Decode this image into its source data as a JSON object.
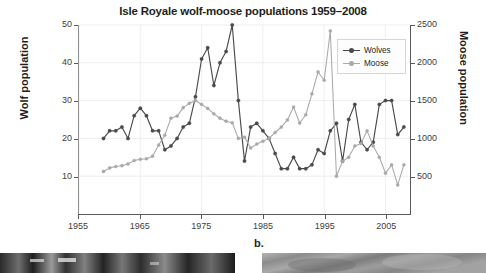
{
  "figure": {
    "panel_letter": "b."
  },
  "chart_data": {
    "type": "line",
    "title": "Isle Royale wolf-moose populations 1959–2008",
    "xlabel": "",
    "ylabel": "Wolf population",
    "y2label": "Moose population",
    "xlim": [
      1955,
      2009
    ],
    "ylim": [
      0,
      50
    ],
    "y2lim": [
      0,
      2500
    ],
    "grid": true,
    "legend_position": "top-right",
    "xticks": [
      1955,
      1965,
      1975,
      1985,
      1995,
      2005
    ],
    "yticks": [
      10,
      20,
      30,
      40,
      50
    ],
    "y2ticks": [
      500,
      1000,
      1500,
      2000,
      2500
    ],
    "x": [
      1959,
      1960,
      1961,
      1962,
      1963,
      1964,
      1965,
      1966,
      1967,
      1968,
      1969,
      1970,
      1971,
      1972,
      1973,
      1974,
      1975,
      1976,
      1977,
      1978,
      1979,
      1980,
      1981,
      1982,
      1983,
      1984,
      1985,
      1986,
      1987,
      1988,
      1989,
      1990,
      1991,
      1992,
      1993,
      1994,
      1995,
      1996,
      1997,
      1998,
      1999,
      2000,
      2001,
      2002,
      2003,
      2004,
      2005,
      2006,
      2007,
      2008
    ],
    "series": [
      {
        "name": "Wolves",
        "axis": "left",
        "color": "#4a4a4c",
        "units": "wolves",
        "values": [
          20,
          22,
          22,
          23,
          20,
          26,
          28,
          26,
          22,
          22,
          17,
          18,
          20,
          23,
          24,
          31,
          41,
          44,
          34,
          40,
          43,
          50,
          30,
          14,
          23,
          24,
          22,
          20,
          16,
          12,
          12,
          15,
          12,
          12,
          13,
          17,
          16,
          22,
          24,
          14,
          25,
          29,
          19,
          17,
          19,
          29,
          30,
          30,
          21,
          23
        ]
      },
      {
        "name": "Moose",
        "axis": "right",
        "color": "#a7a9ac",
        "units": "moose",
        "values": [
          563,
          610,
          628,
          639,
          663,
          707,
          724,
          731,
          765,
          912,
          1042,
          1268,
          1295,
          1407,
          1464,
          1502,
          1449,
          1397,
          1325,
          1267,
          1228,
          1207,
          1000,
          1016,
          873,
          926,
          962,
          1000,
          1078,
          1150,
          1244,
          1415,
          1203,
          1313,
          1590,
          1879,
          1770,
          2422,
          500,
          700,
          750,
          900,
          934,
          1100,
          900,
          750,
          540,
          650,
          385,
          650
        ]
      }
    ]
  }
}
